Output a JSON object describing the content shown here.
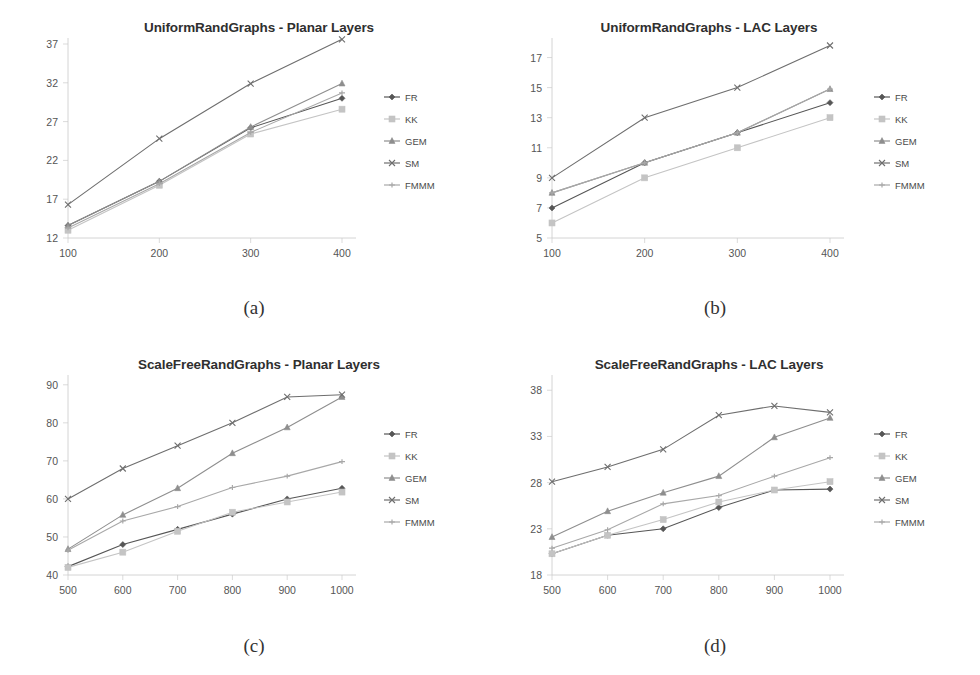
{
  "figure": {
    "background": "#ffffff",
    "series_names": [
      "FR",
      "KK",
      "GEM",
      "SM",
      "FMMM"
    ],
    "series_colors": [
      "#565656",
      "#c4c4c4",
      "#8e8e8e",
      "#6e6e6e",
      "#a8a8a8"
    ],
    "series_markers": [
      "diamond",
      "square",
      "triangle",
      "x",
      "plus"
    ]
  },
  "panels": [
    {
      "caption": "(a)",
      "title": "UniformRandGraphs - Planar Layers"
    },
    {
      "caption": "(b)",
      "title": "UniformRandGraphs - LAC Layers"
    },
    {
      "caption": "(c)",
      "title": "ScaleFreeRandGraphs - Planar Layers"
    },
    {
      "caption": "(d)",
      "title": "ScaleFreeRandGraphs - LAC Layers"
    }
  ],
  "chart_data": [
    {
      "type": "line",
      "title": "UniformRandGraphs - Planar Layers",
      "caption": "(a)",
      "xlabel": "",
      "ylabel": "",
      "categories": [
        100,
        200,
        300,
        400
      ],
      "xticks": [
        "100",
        "200",
        "300",
        "400"
      ],
      "yticks": [
        "12",
        "17",
        "22",
        "27",
        "32",
        "37"
      ],
      "ylim": [
        12,
        37
      ],
      "xlim": [
        100,
        400
      ],
      "grid": false,
      "legend_position": "right",
      "series": [
        {
          "name": "FR",
          "values": [
            13.6,
            19.3,
            26.2,
            30.0
          ]
        },
        {
          "name": "KK",
          "values": [
            13.0,
            18.8,
            25.4,
            28.6
          ]
        },
        {
          "name": "GEM",
          "values": [
            13.6,
            19.3,
            26.3,
            31.9
          ]
        },
        {
          "name": "SM",
          "values": [
            16.3,
            24.8,
            31.9,
            37.6
          ]
        },
        {
          "name": "FMMM",
          "values": [
            13.3,
            19.0,
            25.6,
            30.7
          ]
        }
      ]
    },
    {
      "type": "line",
      "title": "UniformRandGraphs - LAC Layers",
      "caption": "(b)",
      "xlabel": "",
      "ylabel": "",
      "categories": [
        100,
        200,
        300,
        400
      ],
      "xticks": [
        "100",
        "200",
        "300",
        "400"
      ],
      "yticks": [
        "5",
        "7",
        "9",
        "11",
        "13",
        "15",
        "17"
      ],
      "ylim": [
        5,
        17.9
      ],
      "xlim": [
        100,
        400
      ],
      "grid": false,
      "legend_position": "right",
      "series": [
        {
          "name": "FR",
          "values": [
            7.0,
            10.0,
            12.0,
            14.0
          ]
        },
        {
          "name": "KK",
          "values": [
            6.0,
            9.0,
            11.0,
            13.0
          ]
        },
        {
          "name": "GEM",
          "values": [
            8.0,
            10.0,
            12.0,
            14.9
          ]
        },
        {
          "name": "SM",
          "values": [
            9.0,
            13.0,
            15.0,
            17.8
          ]
        },
        {
          "name": "FMMM",
          "values": [
            8.0,
            10.0,
            12.0,
            14.9
          ]
        }
      ]
    },
    {
      "type": "line",
      "title": "ScaleFreeRandGraphs - Planar Layers",
      "caption": "(c)",
      "xlabel": "",
      "ylabel": "",
      "categories": [
        500,
        600,
        700,
        800,
        900,
        1000
      ],
      "xticks": [
        "500",
        "600",
        "700",
        "800",
        "900",
        "1000"
      ],
      "yticks": [
        "40",
        "50",
        "60",
        "70",
        "80",
        "90"
      ],
      "ylim": [
        40,
        91
      ],
      "xlim": [
        500,
        1000
      ],
      "grid": false,
      "legend_position": "right",
      "series": [
        {
          "name": "FR",
          "values": [
            42.2,
            48.0,
            52.0,
            56.0,
            60.0,
            62.8
          ]
        },
        {
          "name": "KK",
          "values": [
            42.0,
            46.0,
            51.5,
            56.5,
            59.2,
            61.8
          ]
        },
        {
          "name": "GEM",
          "values": [
            46.8,
            55.8,
            62.8,
            72.0,
            78.8,
            86.8
          ]
        },
        {
          "name": "SM",
          "values": [
            60.0,
            68.0,
            74.0,
            80.0,
            86.8,
            87.4
          ]
        },
        {
          "name": "FMMM",
          "values": [
            46.5,
            54.2,
            58.0,
            63.0,
            66.0,
            69.8
          ]
        }
      ]
    },
    {
      "type": "line",
      "title": "ScaleFreeRandGraphs - LAC Layers",
      "caption": "(d)",
      "xlabel": "",
      "ylabel": "",
      "categories": [
        500,
        600,
        700,
        800,
        900,
        1000
      ],
      "xticks": [
        "500",
        "600",
        "700",
        "800",
        "900",
        "1000"
      ],
      "yticks": [
        "18",
        "23",
        "28",
        "33",
        "38"
      ],
      "ylim": [
        18,
        39
      ],
      "xlim": [
        500,
        1000
      ],
      "grid": false,
      "legend_position": "right",
      "series": [
        {
          "name": "FR",
          "values": [
            20.3,
            22.3,
            23.0,
            25.3,
            27.2,
            27.3
          ]
        },
        {
          "name": "KK",
          "values": [
            20.3,
            22.3,
            24.0,
            25.9,
            27.2,
            28.1
          ]
        },
        {
          "name": "GEM",
          "values": [
            22.1,
            24.9,
            26.9,
            28.7,
            32.9,
            35.0
          ]
        },
        {
          "name": "SM",
          "values": [
            28.1,
            29.7,
            31.6,
            35.3,
            36.3,
            35.6
          ]
        },
        {
          "name": "FMMM",
          "values": [
            20.9,
            22.9,
            25.7,
            26.6,
            28.7,
            30.7
          ]
        }
      ]
    }
  ]
}
